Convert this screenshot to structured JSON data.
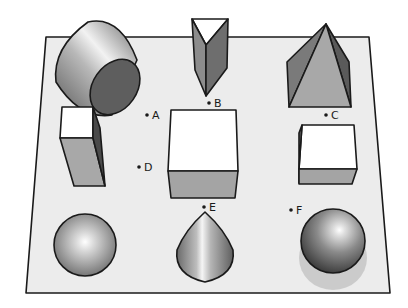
{
  "figure": {
    "plane_color": "#ececec",
    "edge_color": "#1a1a1a"
  },
  "shapes": [
    {
      "name": "cylinder",
      "position": "top-left"
    },
    {
      "name": "triangular-prism",
      "position": "top-center"
    },
    {
      "name": "square-pyramid",
      "position": "top-right"
    },
    {
      "name": "tall-rectangular-prism",
      "position": "middle-left"
    },
    {
      "name": "large-cube",
      "position": "center"
    },
    {
      "name": "small-cube",
      "position": "middle-right"
    },
    {
      "name": "sphere-matte",
      "position": "bottom-left"
    },
    {
      "name": "cone",
      "position": "bottom-center"
    },
    {
      "name": "sphere-glossy",
      "position": "bottom-right"
    }
  ],
  "points": [
    {
      "label": "A"
    },
    {
      "label": "B"
    },
    {
      "label": "C"
    },
    {
      "label": "D"
    },
    {
      "label": "E"
    },
    {
      "label": "F"
    }
  ]
}
